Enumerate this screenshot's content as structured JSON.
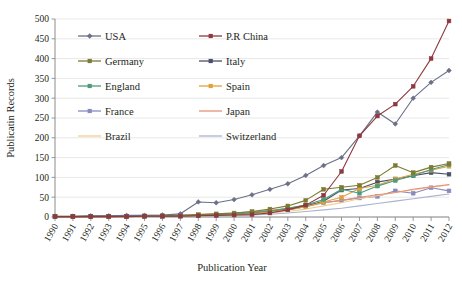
{
  "chart_data": {
    "type": "line",
    "title": "",
    "xlabel": "Publication Year",
    "ylabel": "Publicatin Records",
    "ylim": [
      0,
      500
    ],
    "ytick_step": 50,
    "yticks": [
      "0",
      "50",
      "100",
      "150",
      "200",
      "250",
      "300",
      "350",
      "400",
      "450",
      "500"
    ],
    "grid": true,
    "legend_position": "top-left-inside",
    "categories": [
      "1990",
      "1991",
      "1992",
      "1993",
      "1994",
      "1995",
      "1996",
      "1997",
      "1998",
      "1999",
      "2000",
      "2001",
      "2002",
      "2003",
      "2004",
      "2005",
      "2006",
      "2007",
      "2008",
      "2009",
      "2010",
      "2011",
      "2012"
    ],
    "series": [
      {
        "name": "USA",
        "color": "#6b6f87",
        "marker": "diamond",
        "values": [
          2,
          2,
          3,
          3,
          4,
          4,
          5,
          8,
          38,
          36,
          44,
          56,
          70,
          84,
          105,
          130,
          150,
          205,
          265,
          235,
          300,
          340,
          370
        ]
      },
      {
        "name": "P.R China",
        "color": "#8c3a3f",
        "marker": "square",
        "values": [
          1,
          1,
          1,
          1,
          1,
          2,
          2,
          2,
          3,
          4,
          5,
          6,
          10,
          18,
          30,
          55,
          115,
          205,
          255,
          285,
          330,
          400,
          495
        ]
      },
      {
        "name": "Germany",
        "color": "#7c7a33",
        "marker": "square",
        "values": [
          1,
          1,
          2,
          2,
          2,
          3,
          3,
          4,
          6,
          8,
          10,
          14,
          20,
          28,
          42,
          70,
          75,
          80,
          100,
          130,
          112,
          126,
          135
        ]
      },
      {
        "name": "Italy",
        "color": "#4b4e6a",
        "marker": "square",
        "values": [
          1,
          1,
          1,
          1,
          2,
          2,
          2,
          3,
          4,
          5,
          7,
          10,
          14,
          20,
          28,
          40,
          68,
          72,
          88,
          96,
          104,
          112,
          108
        ]
      },
      {
        "name": "England",
        "color": "#4f9b7a",
        "marker": "square",
        "values": [
          1,
          1,
          1,
          2,
          2,
          2,
          3,
          3,
          4,
          6,
          8,
          11,
          15,
          22,
          30,
          44,
          70,
          60,
          78,
          92,
          104,
          120,
          132
        ]
      },
      {
        "name": "Spain",
        "color": "#e0a33a",
        "marker": "square",
        "values": [
          1,
          1,
          1,
          1,
          2,
          2,
          2,
          3,
          4,
          5,
          6,
          9,
          13,
          18,
          26,
          38,
          50,
          72,
          80,
          96,
          108,
          118,
          128
        ]
      },
      {
        "name": "France",
        "color": "#8a8ac0",
        "marker": "square",
        "values": [
          1,
          1,
          1,
          1,
          1,
          2,
          2,
          2,
          3,
          4,
          6,
          8,
          12,
          18,
          26,
          36,
          42,
          48,
          52,
          66,
          60,
          74,
          66
        ]
      },
      {
        "name": "Japan",
        "color": "#e79078",
        "marker": "none",
        "values": [
          2,
          2,
          3,
          3,
          3,
          4,
          4,
          5,
          6,
          8,
          10,
          13,
          17,
          22,
          30,
          36,
          42,
          50,
          56,
          62,
          70,
          76,
          82
        ]
      },
      {
        "name": "Brazil",
        "color": "#f0cf8e",
        "marker": "none",
        "values": [
          1,
          1,
          1,
          1,
          1,
          1,
          2,
          2,
          3,
          4,
          5,
          7,
          10,
          14,
          20,
          28,
          36,
          46,
          54,
          62,
          68,
          76,
          80
        ]
      },
      {
        "name": "Switzerland",
        "color": "#aab4cf",
        "marker": "none",
        "values": [
          1,
          1,
          1,
          1,
          1,
          1,
          1,
          2,
          2,
          3,
          4,
          5,
          7,
          10,
          14,
          18,
          22,
          28,
          34,
          40,
          46,
          52,
          58
        ]
      }
    ],
    "legend": [
      {
        "label": "USA",
        "color": "#6b6f87",
        "marker": "diamond"
      },
      {
        "label": "P.R China",
        "color": "#8c3a3f",
        "marker": "square"
      },
      {
        "label": "Germany",
        "color": "#7c7a33",
        "marker": "square"
      },
      {
        "label": "Italy",
        "color": "#4b4e6a",
        "marker": "square"
      },
      {
        "label": "England",
        "color": "#4f9b7a",
        "marker": "square"
      },
      {
        "label": "Spain",
        "color": "#e0a33a",
        "marker": "square"
      },
      {
        "label": "France",
        "color": "#8a8ac0",
        "marker": "square"
      },
      {
        "label": "Japan",
        "color": "#e79078",
        "marker": "none"
      },
      {
        "label": "Brazil",
        "color": "#f0cf8e",
        "marker": "none"
      },
      {
        "label": "Switzerland",
        "color": "#aab4cf",
        "marker": "none"
      }
    ]
  }
}
